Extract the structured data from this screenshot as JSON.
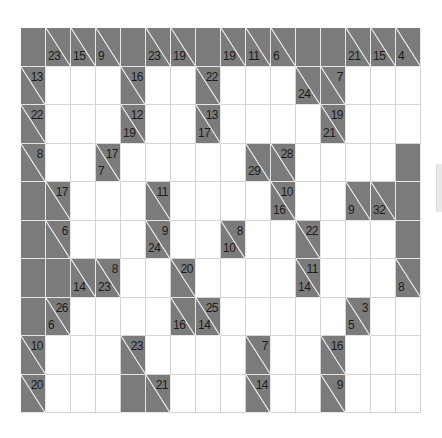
{
  "puzzle": {
    "type": "kakuro",
    "rows": 10,
    "cols": 16,
    "colors": {
      "block": "#7b7b7b",
      "white": "#ffffff",
      "text": "#1c1c1c",
      "diagonal": "#f0f0f0"
    },
    "grid": [
      [
        {
          "t": "B"
        },
        {
          "t": "C",
          "d": "23"
        },
        {
          "t": "C",
          "d": "15"
        },
        {
          "t": "C",
          "d": "9"
        },
        {
          "t": "B"
        },
        {
          "t": "C",
          "d": "23"
        },
        {
          "t": "C",
          "d": "19"
        },
        {
          "t": "B"
        },
        {
          "t": "C",
          "d": "19"
        },
        {
          "t": "C",
          "d": "11"
        },
        {
          "t": "C",
          "d": "6"
        },
        {
          "t": "B"
        },
        {
          "t": "B"
        },
        {
          "t": "C",
          "d": "21"
        },
        {
          "t": "C",
          "d": "15"
        },
        {
          "t": "C",
          "d": "4"
        }
      ],
      [
        {
          "t": "C",
          "a": "13"
        },
        {
          "t": "W"
        },
        {
          "t": "W"
        },
        {
          "t": "W"
        },
        {
          "t": "C",
          "a": "16"
        },
        {
          "t": "W"
        },
        {
          "t": "W"
        },
        {
          "t": "C",
          "a": "22"
        },
        {
          "t": "W"
        },
        {
          "t": "W"
        },
        {
          "t": "W"
        },
        {
          "t": "C",
          "d": "24"
        },
        {
          "t": "C",
          "a": "7"
        },
        {
          "t": "W"
        },
        {
          "t": "W"
        },
        {
          "t": "W"
        }
      ],
      [
        {
          "t": "C",
          "a": "22"
        },
        {
          "t": "W"
        },
        {
          "t": "W"
        },
        {
          "t": "W"
        },
        {
          "t": "C",
          "a": "12",
          "d": "19"
        },
        {
          "t": "W"
        },
        {
          "t": "W"
        },
        {
          "t": "C",
          "a": "13",
          "d": "17"
        },
        {
          "t": "W"
        },
        {
          "t": "W"
        },
        {
          "t": "W"
        },
        {
          "t": "W"
        },
        {
          "t": "C",
          "a": "19",
          "d": "21"
        },
        {
          "t": "W"
        },
        {
          "t": "W"
        },
        {
          "t": "W"
        }
      ],
      [
        {
          "t": "C",
          "a": "8"
        },
        {
          "t": "W"
        },
        {
          "t": "W"
        },
        {
          "t": "C",
          "a": "17",
          "d": "7"
        },
        {
          "t": "W"
        },
        {
          "t": "W"
        },
        {
          "t": "W"
        },
        {
          "t": "W"
        },
        {
          "t": "W"
        },
        {
          "t": "C",
          "d": "29"
        },
        {
          "t": "C",
          "a": "28"
        },
        {
          "t": "W"
        },
        {
          "t": "W"
        },
        {
          "t": "W"
        },
        {
          "t": "W"
        },
        {
          "t": "B"
        }
      ],
      [
        {
          "t": "B"
        },
        {
          "t": "C",
          "a": "17"
        },
        {
          "t": "W"
        },
        {
          "t": "W"
        },
        {
          "t": "W"
        },
        {
          "t": "C",
          "a": "11"
        },
        {
          "t": "W"
        },
        {
          "t": "W"
        },
        {
          "t": "W"
        },
        {
          "t": "W"
        },
        {
          "t": "C",
          "a": "10",
          "d": "16"
        },
        {
          "t": "W"
        },
        {
          "t": "W"
        },
        {
          "t": "C",
          "d": "9"
        },
        {
          "t": "C",
          "d": "32"
        },
        {
          "t": "B"
        }
      ],
      [
        {
          "t": "B"
        },
        {
          "t": "C",
          "a": "6"
        },
        {
          "t": "W"
        },
        {
          "t": "W"
        },
        {
          "t": "W"
        },
        {
          "t": "C",
          "a": "9",
          "d": "24"
        },
        {
          "t": "W"
        },
        {
          "t": "W"
        },
        {
          "t": "C",
          "a": "8",
          "d": "10"
        },
        {
          "t": "W"
        },
        {
          "t": "W"
        },
        {
          "t": "C",
          "a": "22"
        },
        {
          "t": "W"
        },
        {
          "t": "W"
        },
        {
          "t": "W"
        },
        {
          "t": "B"
        }
      ],
      [
        {
          "t": "B"
        },
        {
          "t": "B"
        },
        {
          "t": "C",
          "d": "14"
        },
        {
          "t": "C",
          "a": "8",
          "d": "23"
        },
        {
          "t": "W"
        },
        {
          "t": "W"
        },
        {
          "t": "C",
          "a": "20"
        },
        {
          "t": "W"
        },
        {
          "t": "W"
        },
        {
          "t": "W"
        },
        {
          "t": "W"
        },
        {
          "t": "C",
          "a": "11",
          "d": "14"
        },
        {
          "t": "W"
        },
        {
          "t": "W"
        },
        {
          "t": "W"
        },
        {
          "t": "C",
          "d": "8"
        }
      ],
      [
        {
          "t": "B"
        },
        {
          "t": "C",
          "a": "26",
          "d": "6"
        },
        {
          "t": "W"
        },
        {
          "t": "W"
        },
        {
          "t": "W"
        },
        {
          "t": "W"
        },
        {
          "t": "C",
          "d": "16"
        },
        {
          "t": "C",
          "a": "25",
          "d": "14"
        },
        {
          "t": "W"
        },
        {
          "t": "W"
        },
        {
          "t": "W"
        },
        {
          "t": "W"
        },
        {
          "t": "W"
        },
        {
          "t": "C",
          "a": "3",
          "d": "5"
        },
        {
          "t": "W"
        },
        {
          "t": "W"
        }
      ],
      [
        {
          "t": "C",
          "a": "10"
        },
        {
          "t": "W"
        },
        {
          "t": "W"
        },
        {
          "t": "W"
        },
        {
          "t": "C",
          "a": "23"
        },
        {
          "t": "W"
        },
        {
          "t": "W"
        },
        {
          "t": "W"
        },
        {
          "t": "W"
        },
        {
          "t": "C",
          "a": "7"
        },
        {
          "t": "W"
        },
        {
          "t": "W"
        },
        {
          "t": "C",
          "a": "16"
        },
        {
          "t": "W"
        },
        {
          "t": "W"
        },
        {
          "t": "W"
        }
      ],
      [
        {
          "t": "C",
          "a": "20"
        },
        {
          "t": "W"
        },
        {
          "t": "W"
        },
        {
          "t": "W"
        },
        {
          "t": "B"
        },
        {
          "t": "C",
          "a": "21"
        },
        {
          "t": "W"
        },
        {
          "t": "W"
        },
        {
          "t": "W"
        },
        {
          "t": "C",
          "a": "14"
        },
        {
          "t": "W"
        },
        {
          "t": "W"
        },
        {
          "t": "C",
          "a": "9"
        },
        {
          "t": "W"
        },
        {
          "t": "W"
        },
        {
          "t": "W"
        }
      ]
    ]
  }
}
